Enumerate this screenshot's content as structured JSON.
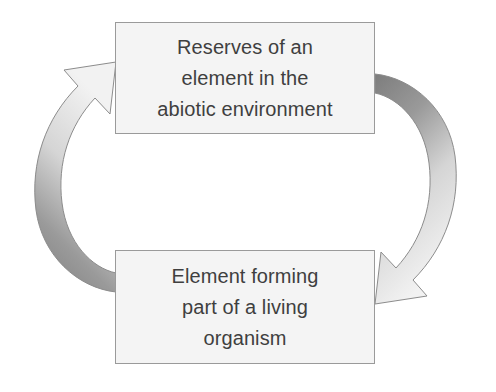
{
  "diagram": {
    "type": "cycle",
    "background_color": "#ffffff",
    "nodes": [
      {
        "id": "reserves",
        "name": "reserves-node",
        "lines": [
          "Reserves of an",
          "element in the",
          "abiotic environment"
        ],
        "fill_color": "#f4f4f4",
        "border_color": "#9a9a9a",
        "text_color": "#3f3f3f"
      },
      {
        "id": "organism",
        "name": "organism-node",
        "lines": [
          "Element forming",
          "part of a living",
          "organism"
        ],
        "fill_color": "#f4f4f4",
        "border_color": "#9a9a9a",
        "text_color": "#3f3f3f"
      }
    ],
    "arrows": [
      {
        "id": "uptake",
        "name": "left-curved-arrow",
        "from": "organism",
        "to": "reserves",
        "direction": "counterclockwise-upward",
        "side": "left",
        "gradient_from": "#808080",
        "gradient_to": "#f0f0f0",
        "outline_color": "#8c8c8c"
      },
      {
        "id": "release",
        "name": "right-curved-arrow",
        "from": "reserves",
        "to": "organism",
        "direction": "clockwise-downward",
        "side": "right",
        "gradient_from": "#808080",
        "gradient_to": "#f0f0f0",
        "outline_color": "#8c8c8c"
      }
    ]
  }
}
